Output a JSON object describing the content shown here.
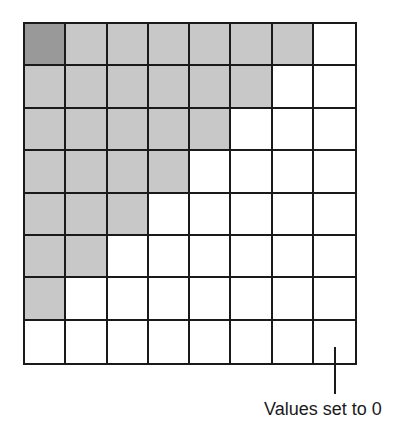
{
  "diagram": {
    "grid": {
      "rows": 8,
      "cols": 8,
      "colors": {
        "empty": "#ffffff",
        "shaded": "#c8c8c8",
        "highlight": "#999999",
        "line": "#1a1a1a"
      },
      "cells": [
        [
          "highlight",
          "shaded",
          "shaded",
          "shaded",
          "shaded",
          "shaded",
          "shaded",
          "empty"
        ],
        [
          "shaded",
          "shaded",
          "shaded",
          "shaded",
          "shaded",
          "shaded",
          "empty",
          "empty"
        ],
        [
          "shaded",
          "shaded",
          "shaded",
          "shaded",
          "shaded",
          "empty",
          "empty",
          "empty"
        ],
        [
          "shaded",
          "shaded",
          "shaded",
          "shaded",
          "empty",
          "empty",
          "empty",
          "empty"
        ],
        [
          "shaded",
          "shaded",
          "shaded",
          "empty",
          "empty",
          "empty",
          "empty",
          "empty"
        ],
        [
          "shaded",
          "shaded",
          "empty",
          "empty",
          "empty",
          "empty",
          "empty",
          "empty"
        ],
        [
          "shaded",
          "empty",
          "empty",
          "empty",
          "empty",
          "empty",
          "empty",
          "empty"
        ],
        [
          "empty",
          "empty",
          "empty",
          "empty",
          "empty",
          "empty",
          "empty",
          "empty"
        ]
      ]
    },
    "annotation": {
      "label": "Values set to 0",
      "points_to": "unshaded cells (lower-right region)"
    }
  }
}
